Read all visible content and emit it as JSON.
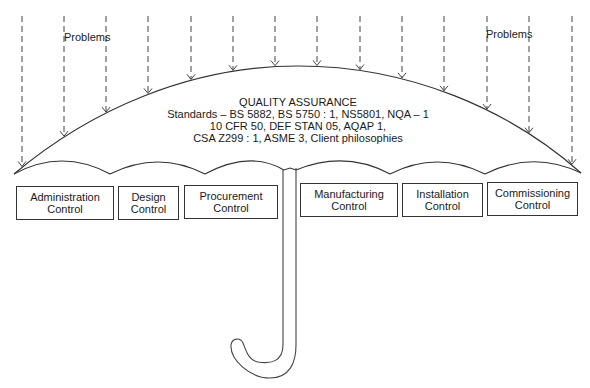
{
  "diagram": {
    "problems_labels": [
      {
        "text": "Problems",
        "x": 64,
        "y": 31
      },
      {
        "text": "Problems",
        "x": 486,
        "y": 28
      }
    ],
    "umbrella_text": {
      "heading": "QUALITY ASSURANCE",
      "lines": [
        "Standards – BS 5882, BS 5750 : 1, NS5801, NQA – 1",
        "10 CFR 50, DEF STAN 05, AQAP 1,",
        "CSA Z299 : 1, ASME 3, Client philosophies"
      ]
    },
    "control_boxes": [
      {
        "line1": "Administration",
        "line2": "Control",
        "x": 16,
        "y": 186,
        "w": 98,
        "h": 34
      },
      {
        "line1": "Design",
        "line2": "Control",
        "x": 118,
        "y": 186,
        "w": 61,
        "h": 34
      },
      {
        "line1": "Procurement",
        "line2": "Control",
        "x": 184,
        "y": 185,
        "w": 94,
        "h": 34
      },
      {
        "line1": "Manufacturing",
        "line2": "Control",
        "x": 300,
        "y": 183,
        "w": 98,
        "h": 34
      },
      {
        "line1": "Installation",
        "line2": "Control",
        "x": 402,
        "y": 183,
        "w": 81,
        "h": 34
      },
      {
        "line1": "Commissioning",
        "line2": "Control",
        "x": 487,
        "y": 182,
        "w": 91,
        "h": 34
      }
    ],
    "arrows_x": [
      22,
      64,
      106,
      148,
      191,
      233,
      275,
      317,
      360,
      402,
      444,
      487,
      529,
      572
    ],
    "colors": {
      "line": "#333333",
      "text": "#1a1a1a",
      "background": "#ffffff"
    }
  }
}
